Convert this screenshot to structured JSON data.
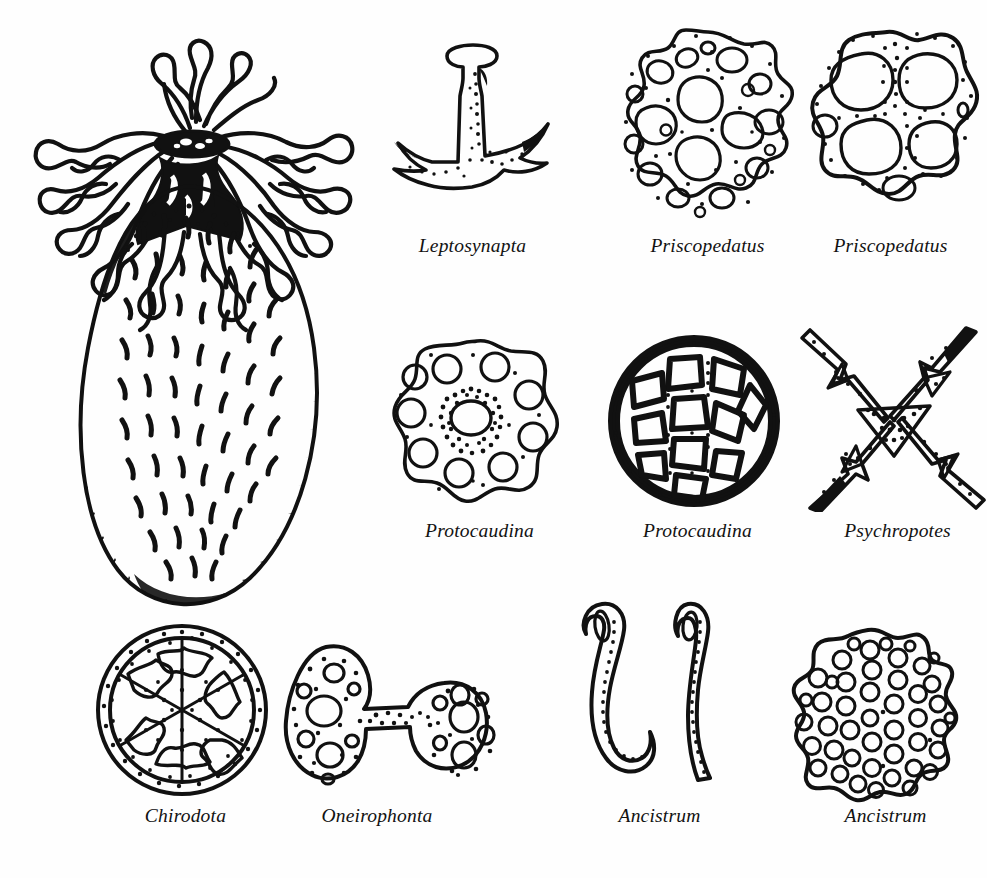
{
  "plate": {
    "title": "Holothuroidea body form and ossicle types",
    "background_color": "#ffffff",
    "ink_color": "#111111",
    "figure_count": 11,
    "label_count": 10
  },
  "habitus": {
    "name": "sea-cucumber-habitus",
    "description": "Whole dendrochirote sea cucumber with branched tentacle crown and spiny ovoid body",
    "label": ""
  },
  "ossicles": [
    {
      "id": "leptosynapta",
      "label": "Leptosynapta",
      "shape": "anchor",
      "row": 1,
      "column": 1
    },
    {
      "id": "priscopedatus-1",
      "label": "Priscopedatus",
      "shape": "perforated-plate",
      "row": 1,
      "column": 2
    },
    {
      "id": "priscopedatus-2",
      "label": "Priscopedatus",
      "shape": "four-holed-plate",
      "row": 1,
      "column": 3
    },
    {
      "id": "protocaudina-1",
      "label": "Protocaudina",
      "shape": "ring-of-holes-plate",
      "row": 2,
      "column": 1
    },
    {
      "id": "protocaudina-2",
      "label": "Protocaudina",
      "shape": "thick-rimmed-wheel",
      "row": 2,
      "column": 2
    },
    {
      "id": "psychropotes",
      "label": "Psychropotes",
      "shape": "cross-spicule",
      "row": 2,
      "column": 3
    },
    {
      "id": "chirodota",
      "label": "Chirodota",
      "shape": "six-spoked-wheel",
      "row": 3,
      "column": 1
    },
    {
      "id": "oneirophonta",
      "label": "Oneirophonta",
      "shape": "dumbbell",
      "row": 3,
      "column": 2
    },
    {
      "id": "ancistrum-hooks",
      "label": "Ancistrum",
      "shape": "paired-hooks",
      "row": 3,
      "column": 3
    },
    {
      "id": "ancistrum-plate",
      "label": "Ancistrum",
      "shape": "sieve-plate",
      "row": 3,
      "column": 4
    }
  ]
}
